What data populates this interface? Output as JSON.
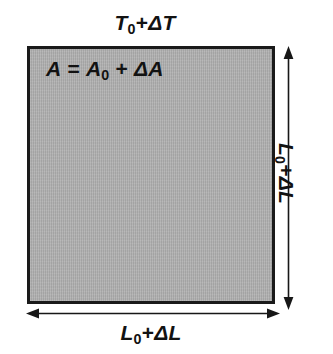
{
  "figure": {
    "background_color": "#ffffff",
    "plate": {
      "name": "expanded-plate",
      "fill_color": "#adadad",
      "border_color": "#1a1a1a"
    }
  },
  "labels": {
    "temperature": {
      "full_text": "T0+ΔT",
      "symbol": "T",
      "subscript": "0",
      "operator": "+",
      "delta_term": "ΔT"
    },
    "area": {
      "full_text": "A = A0 + ΔA",
      "lhs": "A",
      "equals": "=",
      "symbol": "A",
      "subscript": "0",
      "operator": "+",
      "delta_term": "ΔA"
    },
    "length_bottom": {
      "full_text": "L0+ΔL",
      "symbol": "L",
      "subscript": "0",
      "operator": "+",
      "delta_term": "ΔL"
    },
    "length_right": {
      "full_text": "L0+ΔL",
      "symbol": "L",
      "subscript": "0",
      "operator": "+",
      "delta_term": "ΔL"
    }
  },
  "arrows": {
    "width_arrow": {
      "name": "width-dimension-arrow",
      "orientation": "horizontal",
      "double_headed": true,
      "color": "#171717"
    },
    "height_arrow": {
      "name": "height-dimension-arrow",
      "orientation": "vertical",
      "double_headed": true,
      "color": "#171717"
    }
  }
}
